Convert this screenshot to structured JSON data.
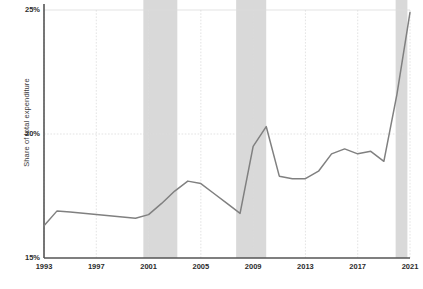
{
  "chart_data": {
    "type": "line",
    "title": "",
    "subtitle": "",
    "xlabel": "",
    "ylabel": "Share of total expenditure",
    "xlim": [
      1993,
      2021
    ],
    "ylim": [
      15,
      25
    ],
    "ytick_labels": [
      "15%",
      "20%",
      "25%"
    ],
    "ytick_values": [
      15,
      20,
      25
    ],
    "xtick_labels": [
      "1993",
      "1997",
      "2001",
      "2005",
      "2009",
      "2013",
      "2017",
      "2021"
    ],
    "xtick_values": [
      1993,
      1997,
      2001,
      2005,
      2009,
      2013,
      2017,
      2021
    ],
    "grid": "dotted light gridlines on both axes",
    "legend": "none",
    "line_color": "#808080",
    "band_color": "#d9d9d9",
    "gridline_color": "#dcdcdc",
    "axis_color": "#555555",
    "x": [
      1993,
      1994,
      1995,
      1996,
      1997,
      1998,
      1999,
      2000,
      2001,
      2002,
      2003,
      2004,
      2005,
      2006,
      2007,
      2008,
      2009,
      2010,
      2011,
      2012,
      2013,
      2014,
      2015,
      2016,
      2017,
      2018,
      2019,
      2020,
      2021
    ],
    "values": [
      16.3,
      16.9,
      16.85,
      16.8,
      16.75,
      16.7,
      16.65,
      16.6,
      16.75,
      17.2,
      17.7,
      18.1,
      18.0,
      17.6,
      17.2,
      16.8,
      19.5,
      20.3,
      18.3,
      18.2,
      18.2,
      18.5,
      19.2,
      19.4,
      19.2,
      19.3,
      18.9,
      21.6,
      24.9
    ],
    "recession_bands": [
      {
        "label": "2001 recession",
        "start": 2000.6,
        "end": 2003.2
      },
      {
        "label": "2008 recession",
        "start": 2007.7,
        "end": 2010.0
      },
      {
        "label": "2020 recession",
        "start": 2019.9,
        "end": 2020.8
      }
    ],
    "series": [
      {
        "name": "Share of total expenditure",
        "values": [
          16.3,
          16.9,
          16.85,
          16.8,
          16.75,
          16.7,
          16.65,
          16.6,
          16.75,
          17.2,
          17.7,
          18.1,
          18.0,
          17.6,
          17.2,
          16.8,
          19.5,
          20.3,
          18.3,
          18.2,
          18.2,
          18.5,
          19.2,
          19.4,
          19.2,
          19.3,
          18.9,
          21.6,
          24.9
        ]
      }
    ]
  }
}
